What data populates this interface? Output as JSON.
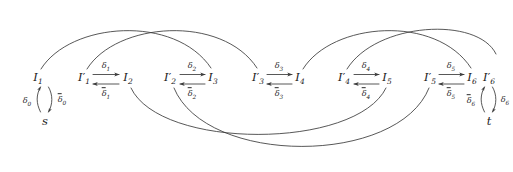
{
  "diagram": {
    "type": "automaton-interval-chain",
    "background": "#ffffff",
    "stroke": "#3a3a3a",
    "nodes": [
      {
        "id": "s",
        "label": "s",
        "x": 45,
        "y": 120
      },
      {
        "id": "I1",
        "label": "I",
        "sub": "1",
        "prime": false,
        "x": 38,
        "y": 78
      },
      {
        "id": "I1p",
        "label": "I",
        "sub": "1",
        "prime": true,
        "x": 84,
        "y": 78
      },
      {
        "id": "I2",
        "label": "I",
        "sub": "2",
        "prime": false,
        "x": 128,
        "y": 78
      },
      {
        "id": "I2p",
        "label": "I",
        "sub": "2",
        "prime": true,
        "x": 170,
        "y": 78
      },
      {
        "id": "I3",
        "label": "I",
        "sub": "3",
        "prime": false,
        "x": 213,
        "y": 78
      },
      {
        "id": "I3p",
        "label": "I",
        "sub": "3",
        "prime": true,
        "x": 258,
        "y": 78
      },
      {
        "id": "I4",
        "label": "I",
        "sub": "4",
        "prime": false,
        "x": 300,
        "y": 78
      },
      {
        "id": "I4p",
        "label": "I",
        "sub": "4",
        "prime": true,
        "x": 344,
        "y": 78
      },
      {
        "id": "I5",
        "label": "I",
        "sub": "5",
        "prime": false,
        "x": 387,
        "y": 78
      },
      {
        "id": "I5p",
        "label": "I",
        "sub": "5",
        "prime": true,
        "x": 430,
        "y": 78
      },
      {
        "id": "I6",
        "label": "I",
        "sub": "6",
        "prime": false,
        "x": 472,
        "y": 78
      },
      {
        "id": "I6p",
        "label": "I",
        "sub": "6",
        "prime": true,
        "x": 489,
        "y": 78
      },
      {
        "id": "t",
        "label": "t",
        "x": 489,
        "y": 120
      }
    ],
    "edge_labels": [
      {
        "id": "delta0",
        "text": "δ",
        "sub": "0",
        "overline": false,
        "x": 27,
        "y": 101
      },
      {
        "id": "delta0bar",
        "text": "δ",
        "sub": "0",
        "overline": true,
        "x": 62,
        "y": 100
      },
      {
        "id": "delta1",
        "text": "δ",
        "sub": "1",
        "overline": false,
        "x": 106,
        "y": 66
      },
      {
        "id": "delta1bar",
        "text": "δ",
        "sub": "1",
        "overline": true,
        "x": 106,
        "y": 94
      },
      {
        "id": "delta2",
        "text": "δ",
        "sub": "2",
        "overline": false,
        "x": 192,
        "y": 66
      },
      {
        "id": "delta2bar",
        "text": "δ",
        "sub": "2",
        "overline": true,
        "x": 192,
        "y": 94
      },
      {
        "id": "delta3",
        "text": "δ",
        "sub": "3",
        "overline": false,
        "x": 279,
        "y": 66
      },
      {
        "id": "delta3bar",
        "text": "δ",
        "sub": "3",
        "overline": true,
        "x": 279,
        "y": 94
      },
      {
        "id": "delta4",
        "text": "δ",
        "sub": "4",
        "overline": false,
        "x": 366,
        "y": 66
      },
      {
        "id": "delta4bar",
        "text": "δ",
        "sub": "4",
        "overline": true,
        "x": 366,
        "y": 94
      },
      {
        "id": "delta5",
        "text": "δ",
        "sub": "5",
        "overline": false,
        "x": 451,
        "y": 66
      },
      {
        "id": "delta5bar",
        "text": "δ",
        "sub": "5",
        "overline": true,
        "x": 451,
        "y": 94
      },
      {
        "id": "delta6bar",
        "text": "δ",
        "sub": "6",
        "overline": true,
        "x": 471,
        "y": 101
      },
      {
        "id": "delta6",
        "text": "δ",
        "sub": "6",
        "overline": false,
        "x": 505,
        "y": 100
      }
    ],
    "arcs": [
      {
        "id": "arc-I1-to-I3",
        "from": "I1",
        "to": "I3",
        "side": "top"
      },
      {
        "id": "arc-I1p-to-I3p",
        "from": "I1p",
        "to": "I3p",
        "side": "top"
      },
      {
        "id": "arc-I4-to-I6",
        "from": "I4",
        "to": "I6",
        "side": "top"
      },
      {
        "id": "arc-I4p-to-I6p",
        "from": "I4p",
        "to": "I6p",
        "side": "top"
      },
      {
        "id": "arc-I2-to-I5",
        "from": "I2",
        "to": "I5",
        "side": "bottom"
      },
      {
        "id": "arc-I2p-to-I5p",
        "from": "I2p",
        "to": "I5p",
        "side": "bottom"
      }
    ]
  }
}
